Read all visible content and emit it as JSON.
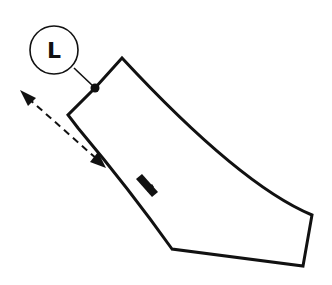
{
  "diagram": {
    "callout": {
      "label": "L"
    },
    "colors": {
      "stroke": "#111111",
      "background": "#ffffff"
    }
  }
}
